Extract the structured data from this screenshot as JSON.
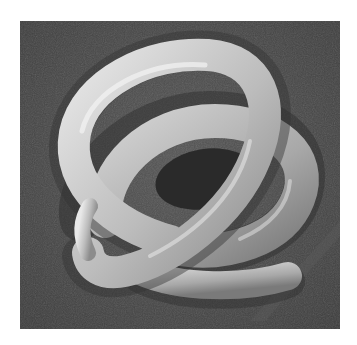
{
  "image": {
    "subject": "Scanning electron micrograph of a coiled nematode worm",
    "background_color": "#ffffff",
    "panel_color": "#4a4a4a",
    "worm_highlight": "#e6e6e6",
    "worm_mid": "#b4b4b4",
    "worm_shadow": "#6e6e6e"
  }
}
